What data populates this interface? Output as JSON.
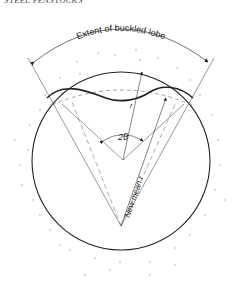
{
  "header": {
    "running_title": "STEEL PENSTOCKS"
  },
  "diagram": {
    "extent_label": "Extent of buckled lobe",
    "angle_label": "2θ",
    "radius_label": "r",
    "new_mean_radius_label": "New mean r",
    "colors": {
      "line": "#222222",
      "thin": "#555555",
      "dots": "#999999",
      "background": "#ffffff"
    }
  }
}
